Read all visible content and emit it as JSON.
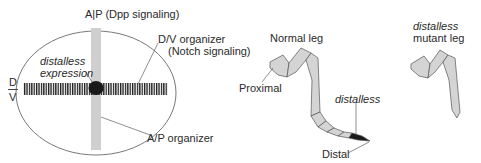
{
  "disc": {
    "ap_label": "A|P (Dpp signaling)",
    "dv_organizer_line1": "D/V organizer",
    "dv_organizer_line2": "(Notch signaling)",
    "distalless_line1": "distalless",
    "distalless_line2": "expression",
    "d_label": "D",
    "v_label": "V",
    "ap_organizer": "A/P organizer"
  },
  "normal_leg": {
    "title": "Normal leg",
    "proximal": "Proximal",
    "distalless": "distalless",
    "distal": "Distal"
  },
  "mutant_leg": {
    "title_line1": "distalless",
    "title_line2": "mutant leg"
  },
  "colors": {
    "outline": "#555555",
    "band": "#cfcfcf",
    "leg_fill": "#d4d4d4",
    "dark": "#1a1a1a"
  }
}
